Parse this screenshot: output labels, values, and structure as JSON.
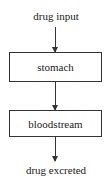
{
  "diagram": {
    "input_label": "drug input",
    "nodes": [
      {
        "label": "stomach"
      },
      {
        "label": "bloodstream"
      }
    ],
    "output_label": "drug excreted",
    "edges": [
      {
        "from": "drug input",
        "to": "stomach"
      },
      {
        "from": "stomach",
        "to": "bloodstream"
      },
      {
        "from": "bloodstream",
        "to": "drug excreted"
      }
    ]
  }
}
